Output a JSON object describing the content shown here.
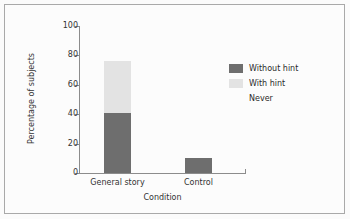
{
  "chart_data": {
    "type": "bar",
    "subtype": "stacked-bar",
    "title": "",
    "xlabel": "Condition",
    "ylabel": "Percentage of subjects",
    "categories": [
      "General story",
      "Control"
    ],
    "ylim": [
      0,
      100
    ],
    "yticks": [
      0,
      20,
      40,
      60,
      80,
      100
    ],
    "ytick_labels": [
      "0",
      "20",
      "40",
      "60",
      "80",
      "100"
    ],
    "grid": false,
    "legend_position": "right",
    "series": [
      {
        "name": "Without hint",
        "color": "#6e6e6e",
        "values": [
          41,
          10
        ]
      },
      {
        "name": "With hint",
        "color": "#e3e3e3",
        "values": [
          35,
          0
        ]
      },
      {
        "name": "Never",
        "color": "#ffffff",
        "values": [
          24,
          90
        ]
      }
    ]
  },
  "legend": {
    "entries": [
      {
        "label": "Without hint",
        "color": "#6e6e6e"
      },
      {
        "label": "With hint",
        "color": "#e3e3e3"
      },
      {
        "label": "Never",
        "color": "#ffffff"
      }
    ]
  },
  "axes": {
    "y_title": "Percentage of subjects",
    "x_title": "Condition",
    "y_ticks": [
      "100",
      "80",
      "60",
      "40",
      "20",
      "0"
    ],
    "x_ticks": [
      "General story",
      "Control"
    ]
  },
  "colors": {
    "without_hint": "#6e6e6e",
    "with_hint": "#e3e3e3",
    "never": "#ffffff",
    "axis": "#8c8c8c",
    "frame": "#a9a9a9",
    "text": "#333333",
    "background": "#fcfcfc"
  }
}
